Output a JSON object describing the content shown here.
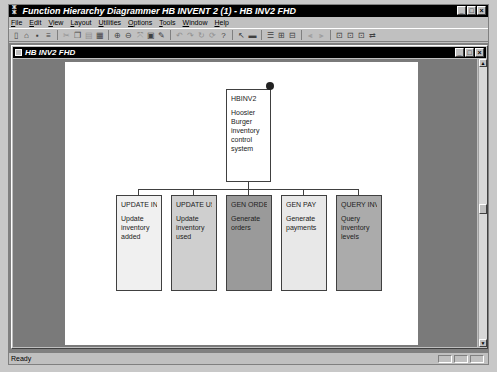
{
  "window": {
    "title": "Function Hierarchy Diagrammer HB INVENT 2 (1) - HB INV2 FHD",
    "controls": [
      "_",
      "□",
      "×"
    ]
  },
  "menubar": [
    "File",
    "Edit",
    "View",
    "Layout",
    "Utilities",
    "Options",
    "Tools",
    "Window",
    "Help"
  ],
  "toolbar": {
    "groups": [
      [
        "new-icon",
        "open-icon",
        "save-icon",
        "print-icon"
      ],
      [
        "cut-icon",
        "copy-icon",
        "paste-icon"
      ],
      [
        "diagram-icon"
      ],
      [
        "zoom-in-icon",
        "zoom-out-icon",
        "fit-icon",
        "properties-icon",
        "edit-icon"
      ],
      [
        "undo-icon",
        "redo-icon",
        "requery-icon",
        "help-icon"
      ],
      [
        "select-pointer-icon",
        "create-function-icon"
      ],
      [
        "layout-icon",
        "expand-icon",
        "collapse-icon"
      ],
      [
        "align-left-icon",
        "align-right-icon"
      ],
      [
        "entity-usage-icon",
        "attribute-usage-icon",
        "module-icon",
        "link-icon"
      ]
    ]
  },
  "child_window": {
    "title": "HB INV2 FHD",
    "controls": [
      "_",
      "□",
      "×"
    ]
  },
  "diagram": {
    "root": {
      "id": "HBINV2",
      "description": "Hoosier Burger inventory control system",
      "fill": "#ffffff"
    },
    "children": [
      {
        "id": "UPDATE IN",
        "description": "Update inventory added",
        "fill": "#f0f0f0"
      },
      {
        "id": "UPDATE US",
        "description": "Update inventory used",
        "fill": "#cfcfcf"
      },
      {
        "id": "GEN ORDE",
        "description": "Generate orders",
        "fill": "#9a9a9a"
      },
      {
        "id": "GEN PAY",
        "description": "Generate payments",
        "fill": "#e8e8e8"
      },
      {
        "id": "QUERY INV",
        "description": "Query inventory levels",
        "fill": "#ababab"
      }
    ]
  },
  "statusbar": {
    "text": "Ready"
  }
}
